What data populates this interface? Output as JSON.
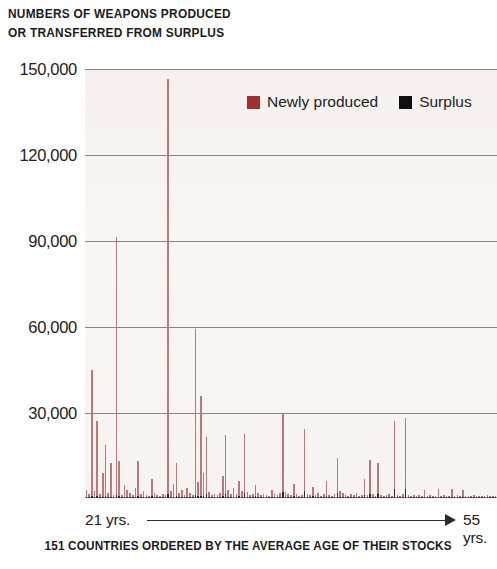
{
  "title": "NUMBERS OF WEAPONS PRODUCED\nOR TRANSFERRED FROM SURPLUS",
  "legend": {
    "newly_produced": "Newly produced",
    "surplus": "Surplus"
  },
  "axis": {
    "x_start": "21 yrs.",
    "x_end": "55 yrs.",
    "y_ticks": [
      "150,000",
      "120,000",
      "90,000",
      "60,000",
      "30,000"
    ]
  },
  "caption": "151 COUNTRIES ORDERED BY THE AVERAGE AGE OF THEIR STOCKS",
  "colors": {
    "newly_produced": "#a0302f",
    "newly_produced_bar": "#b9787c",
    "surplus": "#120d0e",
    "surplus_bar": "#3a2326",
    "gridline": "#8a8384",
    "plot_background": "#f7f4f2",
    "text": "#1b1b1b"
  },
  "chart_data": {
    "type": "bar",
    "title": "NUMBERS OF WEAPONS PRODUCED OR TRANSFERRED FROM SURPLUS",
    "subtitle": "151 COUNTRIES ORDERED BY THE AVERAGE AGE OF THEIR STOCKS",
    "xlabel": "151 countries ordered by the average age of their stocks (21 yrs. to 55 yrs.)",
    "ylabel": "",
    "ylim": [
      0,
      155000
    ],
    "yticks": [
      30000,
      60000,
      90000,
      120000,
      150000
    ],
    "ytick_labels": [
      "30,000",
      "60,000",
      "90,000",
      "120,000",
      "150,000"
    ],
    "grid": true,
    "stacked": true,
    "legend_position": "top-right",
    "legend": [
      "Newly produced",
      "Surplus"
    ],
    "x_axis_annotation": {
      "start": "21 yrs.",
      "end": "55 yrs.",
      "arrow": true
    },
    "n_categories": 151,
    "series": [
      {
        "name": "Newly produced",
        "color": "#b9787c",
        "values": [
          2600,
          1200,
          45500,
          2200,
          27000,
          1400,
          8500,
          18500,
          1600,
          12000,
          1000,
          93000,
          12500,
          1100,
          4300,
          2700,
          1500,
          900,
          3300,
          12800,
          1400,
          2400,
          1100,
          800,
          6200,
          1500,
          900,
          700,
          1200,
          1000,
          150000,
          2100,
          4600,
          12000,
          1500,
          2500,
          1000,
          3200,
          1700,
          900,
          60000,
          5200,
          36000,
          8500,
          20500,
          2000,
          900,
          1400,
          1100,
          1600,
          7200,
          21000,
          2500,
          1200,
          3000,
          1400,
          5500,
          2200,
          21500,
          1800,
          900,
          1200,
          4000,
          1500,
          800,
          1100,
          1000,
          700,
          2600,
          1200,
          900,
          1500,
          28500,
          2000,
          1100,
          900,
          4200,
          1300,
          700,
          1000,
          22500,
          1200,
          800,
          3500,
          900,
          1400,
          600,
          1100,
          5200,
          900,
          700,
          1300,
          12800,
          2200,
          1500,
          900,
          600,
          1100,
          800,
          1400,
          700,
          1000,
          5800,
          900,
          12000,
          1300,
          700,
          11000,
          900,
          600,
          800,
          1200,
          700,
          24500,
          900,
          600,
          1100,
          25500,
          800,
          700,
          1000,
          600,
          900,
          700,
          2500,
          600,
          800,
          500,
          700,
          2800,
          600,
          900,
          500,
          700,
          2600,
          600,
          800,
          500,
          2400,
          600,
          700,
          500,
          900,
          600,
          500,
          700,
          600,
          900,
          500,
          700,
          600
        ]
      },
      {
        "name": "Surplus",
        "color": "#3a2326",
        "values": [
          400,
          200,
          900,
          300,
          800,
          200,
          400,
          600,
          200,
          500,
          150,
          1200,
          700,
          150,
          400,
          300,
          200,
          120,
          350,
          700,
          200,
          300,
          150,
          100,
          600,
          200,
          120,
          100,
          180,
          150,
          1500,
          300,
          500,
          800,
          200,
          350,
          150,
          400,
          250,
          120,
          1100,
          600,
          900,
          700,
          1400,
          300,
          120,
          200,
          150,
          250,
          800,
          1600,
          400,
          180,
          450,
          200,
          700,
          350,
          1800,
          300,
          150,
          200,
          600,
          250,
          120,
          180,
          150,
          100,
          400,
          200,
          150,
          250,
          2200,
          350,
          180,
          150,
          700,
          220,
          100,
          160,
          2400,
          200,
          130,
          600,
          150,
          240,
          100,
          180,
          900,
          150,
          120,
          220,
          1800,
          380,
          260,
          150,
          100,
          180,
          130,
          240,
          120,
          170,
          1000,
          150,
          1600,
          220,
          120,
          1500,
          150,
          100,
          130,
          200,
          120,
          3200,
          150,
          100,
          180,
          3400,
          130,
          120,
          170,
          100,
          150,
          120,
          450,
          100,
          130,
          90,
          120,
          500,
          100,
          150,
          90,
          120,
          480,
          100,
          130,
          90,
          430,
          100,
          120,
          90,
          150,
          100,
          90,
          120,
          100,
          150,
          90,
          120,
          100
        ]
      }
    ]
  }
}
